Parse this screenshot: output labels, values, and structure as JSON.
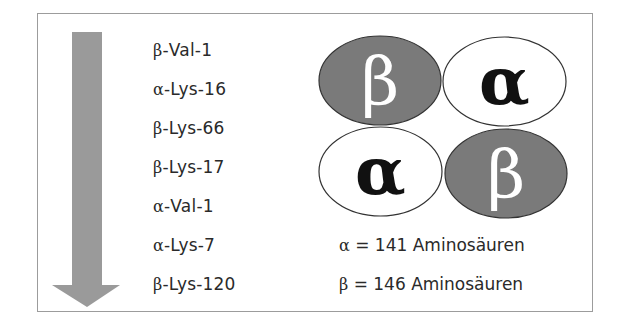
{
  "figure": {
    "colors": {
      "frame_border": "#9c9c9c",
      "arrow_fill": "#9a9a9a",
      "beta_fill": "#7a7a7a",
      "beta_stroke": "#333333",
      "alpha_fill": "#ffffff",
      "alpha_stroke": "#333333",
      "beta_text": "#ffffff",
      "alpha_text": "#111111",
      "text": "#2a2a2a"
    },
    "arrow": {
      "direction": "down",
      "semantic": "order-arrow"
    },
    "residues": [
      {
        "chain": "β",
        "label": "-Val-1"
      },
      {
        "chain": "α",
        "label": "-Lys-16"
      },
      {
        "chain": "β",
        "label": "-Lys-66"
      },
      {
        "chain": "β",
        "label": "-Lys-17"
      },
      {
        "chain": "α",
        "label": "-Val-1"
      },
      {
        "chain": "α",
        "label": "-Lys-7"
      },
      {
        "chain": "β",
        "label": "-Lys-120"
      }
    ],
    "subunits": [
      {
        "position": "top-left",
        "symbol": "β",
        "type": "beta"
      },
      {
        "position": "top-right",
        "symbol": "α",
        "type": "alpha"
      },
      {
        "position": "bottom-left",
        "symbol": "α",
        "type": "alpha"
      },
      {
        "position": "bottom-right",
        "symbol": "β",
        "type": "beta"
      }
    ],
    "captions": [
      {
        "symbol": "α",
        "text": " = 141 Aminosäuren"
      },
      {
        "symbol": "β",
        "text": " = 146 Aminosäuren"
      }
    ]
  }
}
